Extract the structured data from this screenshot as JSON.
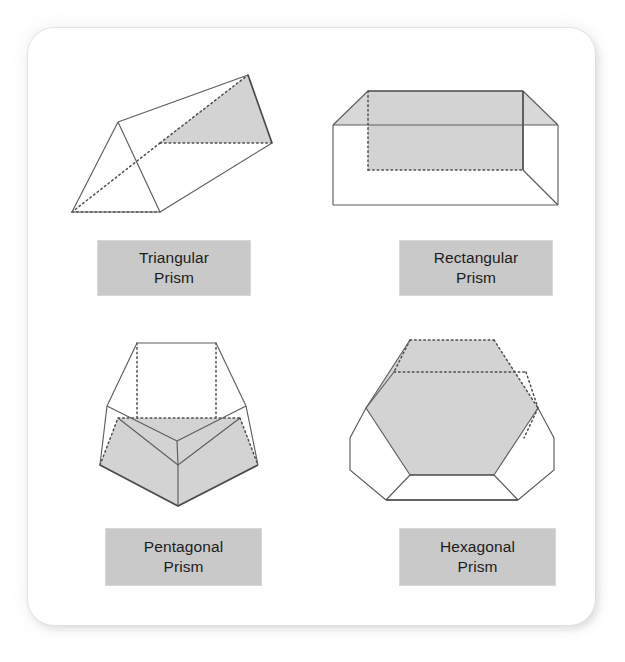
{
  "page": {
    "background_color": "#ffffff",
    "panel_color": "#ffffff",
    "panel_border_radius": 26
  },
  "style": {
    "label_box_color": "#c9c9c9",
    "label_text_color": "#1c1c1c",
    "edge_color": "#5d5d5d",
    "hidden_edge_color": "#4f4f4f",
    "shaded_face_color": "#d3d3d3"
  },
  "figures": [
    {
      "id": "triangular-prism",
      "label_line1": "Triangular",
      "label_line2": "Prism",
      "sides": 3,
      "shaded_face": "right-end-triangle",
      "hidden_edges": "dotted"
    },
    {
      "id": "rectangular-prism",
      "label_line1": "Rectangular",
      "label_line2": "Prism",
      "sides": 4,
      "shaded_face": "back-left-faces",
      "hidden_edges": "dotted"
    },
    {
      "id": "pentagonal-prism",
      "label_line1": "Pentagonal",
      "label_line2": "Prism",
      "sides": 5,
      "shaded_face": "bottom-pentagon",
      "hidden_edges": "dotted"
    },
    {
      "id": "hexagonal-prism",
      "label_line1": "Hexagonal",
      "label_line2": "Prism",
      "sides": 6,
      "shaded_face": "top-hexagon",
      "hidden_edges": "dotted"
    }
  ]
}
